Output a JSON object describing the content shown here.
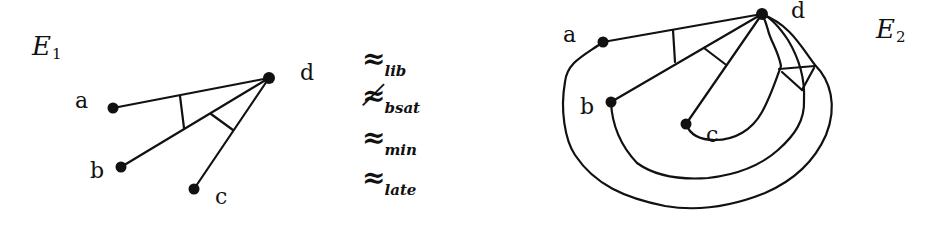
{
  "figure": {
    "left_diagram": {
      "name": "E",
      "index": "1",
      "nodes": [
        {
          "id": "a",
          "label": "a",
          "x": 113,
          "y": 108
        },
        {
          "id": "b",
          "label": "b",
          "x": 121,
          "y": 167
        },
        {
          "id": "c",
          "label": "c",
          "x": 194,
          "y": 189
        },
        {
          "id": "d",
          "label": "d",
          "x": 269,
          "y": 78
        }
      ],
      "edges": [
        [
          "a",
          "d"
        ],
        [
          "b",
          "d"
        ],
        [
          "c",
          "d"
        ]
      ]
    },
    "relations": [
      {
        "symbol": "≈",
        "subscript": "lib",
        "negated": false
      },
      {
        "symbol": "≉",
        "subscript": "bsat",
        "negated": true
      },
      {
        "symbol": "≈",
        "subscript": "min",
        "negated": false
      },
      {
        "symbol": "≈",
        "subscript": "late",
        "negated": false
      }
    ],
    "right_diagram": {
      "name": "E",
      "index": "2",
      "nodes": [
        {
          "id": "a",
          "label": "a",
          "x": 603,
          "y": 42
        },
        {
          "id": "b",
          "label": "b",
          "x": 611,
          "y": 102
        },
        {
          "id": "c",
          "label": "c",
          "x": 686,
          "y": 124
        },
        {
          "id": "d",
          "label": "d",
          "x": 762,
          "y": 14
        }
      ],
      "edges": [
        [
          "a",
          "d"
        ],
        [
          "b",
          "d"
        ],
        [
          "c",
          "d"
        ],
        [
          "a",
          "d",
          "curved"
        ],
        [
          "b",
          "d",
          "curved"
        ],
        [
          "c",
          "d",
          "curved"
        ]
      ]
    },
    "colors": {
      "ink": "#111111",
      "background": "#ffffff"
    }
  }
}
